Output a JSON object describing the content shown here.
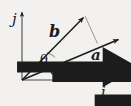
{
  "figure": {
    "background_color": "#f2f1ef",
    "line_color": "#1c1c1c",
    "thin_line_color": "#8d8d8d"
  },
  "axes": {
    "x_axis": {
      "name": "i-hat",
      "label": "i",
      "has_vector_accent": true,
      "origin": [
        22,
        80
      ],
      "tip": [
        120,
        80
      ]
    },
    "y_axis": {
      "name": "j-hat",
      "label": "j",
      "has_vector_accent": true,
      "origin": [
        22,
        80
      ],
      "tip": [
        22,
        10
      ]
    }
  },
  "vectors": [
    {
      "name": "vector-b",
      "label": "b",
      "has_vector_accent": true,
      "origin": [
        22,
        80
      ],
      "tip": [
        85,
        15
      ],
      "label_position": [
        49,
        24
      ]
    },
    {
      "name": "vector-a",
      "label": "a",
      "has_vector_accent": true,
      "origin": [
        22,
        80
      ],
      "tip": [
        121,
        38
      ],
      "label_position": [
        91,
        48
      ]
    }
  ],
  "projection_line": {
    "name": "projection-of-b-onto-a",
    "from": [
      85,
      15
    ],
    "to": [
      97,
      43
    ],
    "style": "thin"
  },
  "angles": [
    {
      "name": "angle-theta",
      "label": "θ",
      "between": [
        "vector-b",
        "vector-a"
      ],
      "arc_radius": 33,
      "label_position": [
        40,
        53
      ]
    },
    {
      "name": "angle-phi",
      "label": "φ",
      "between": [
        "vector-a",
        "i-hat"
      ],
      "arc_radius": 48,
      "label_position": [
        50,
        63
      ]
    }
  ]
}
